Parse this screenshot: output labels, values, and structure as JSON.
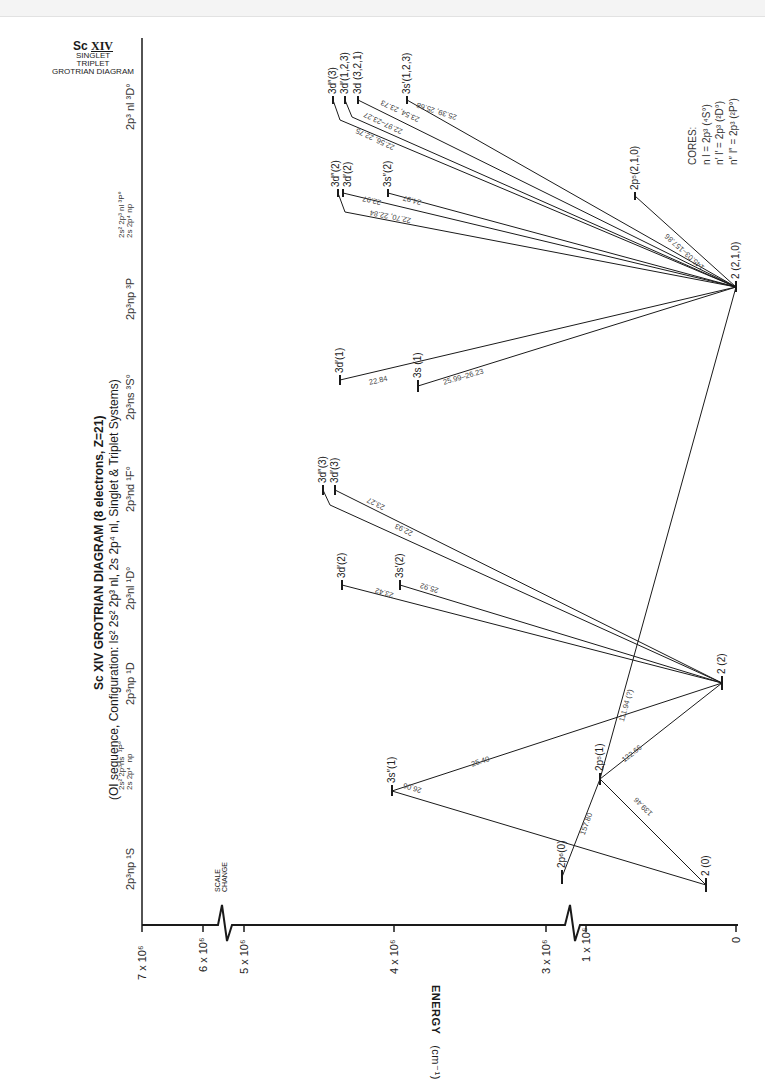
{
  "title_block": {
    "ion": "Sc",
    "ion_stage": "XIV",
    "line2": "SINGLET",
    "line3": "TRIPLET",
    "line4": "GROTRIAN  DIAGRAM"
  },
  "heading": {
    "line1": "Sc XIV  GROTRIAN DIAGRAM  (8 electrons, Z=21)",
    "line2": "(OI  sequence,  Configuration: ls² 2s² 2p³  nl, 2s 2p⁴ nl, Singlet & Triplet  Systems)"
  },
  "columns": [
    {
      "id": "1S",
      "label": "2p³np  ¹S"
    },
    {
      "id": "1Po",
      "label": "2s² 2p³ns  ¹P°\n2s 2p⁴  np"
    },
    {
      "id": "1D",
      "label": "2p³np  ¹D"
    },
    {
      "id": "1Do",
      "label": "2p³nl  ¹D°"
    },
    {
      "id": "1Fo",
      "label": "2p³nd ¹F°"
    },
    {
      "id": "3So",
      "label": "2p³ns  ³S°"
    },
    {
      "id": "3P",
      "label": "2p³np  ³P"
    },
    {
      "id": "3Po",
      "label": "2s² 2p³ nl ³P°\n2s 2p⁴ np"
    },
    {
      "id": "3Do",
      "label": "2p³ nl  ³D°"
    }
  ],
  "axis": {
    "title": "ENERGY",
    "unit": "(cm⁻¹)",
    "ticks": [
      "7 x 10⁶",
      "6 x 10⁶",
      "5 x 10⁶",
      "4 x 10⁶",
      "3 x 10⁶",
      "1 x 10⁶",
      "0"
    ],
    "scale_change_label": "SCALE\nCHANGE"
  },
  "cores": {
    "title": "CORES:",
    "lines": [
      "n l  =  2p³ (⁴S°)",
      "n′ l′  =  2p³ (²D°)",
      "n″ l″  =  2p³ (²P°)"
    ]
  },
  "levels": [
    {
      "id": "2_0",
      "label": "2 (0)"
    },
    {
      "id": "2p6_0",
      "label": "2p⁶(0)"
    },
    {
      "id": "2p5_1",
      "label": "2p⁵(1)"
    },
    {
      "id": "3s2_1",
      "label": "3s″(1)"
    },
    {
      "id": "2_2",
      "label": "2 (2)"
    },
    {
      "id": "3d2_2",
      "label": "3d′(2)"
    },
    {
      "id": "3s2_2b",
      "label": "3s′(2)"
    },
    {
      "id": "3dpp_3",
      "label": "3d″(3)"
    },
    {
      "id": "3dp_3",
      "label": "3d′(3)"
    },
    {
      "id": "3dp_1",
      "label": "3d′(1)"
    },
    {
      "id": "3s_1",
      "label": "3s (1)"
    },
    {
      "id": "2_210",
      "label": "2 (2,1,0)"
    },
    {
      "id": "3dpp_2",
      "label": "3d″(2)"
    },
    {
      "id": "3dp_2",
      "label": "3d′(2)"
    },
    {
      "id": "3spp_2",
      "label": "3s″(2)"
    },
    {
      "id": "2p5_210",
      "label": "2p⁵(2,1,0)"
    },
    {
      "id": "3dpp_3b",
      "label": "3d″(3)"
    },
    {
      "id": "3dp_123",
      "label": "3d′(1,2,3)"
    },
    {
      "id": "3d_321",
      "label": "3d (3,2,1)"
    },
    {
      "id": "3sp_123",
      "label": "3s′(1,2,3)"
    }
  ],
  "transitions": [
    {
      "label": "25.40"
    },
    {
      "label": "26.06"
    },
    {
      "label": "157.80"
    },
    {
      "label": "139.46"
    },
    {
      "label": "122.66"
    },
    {
      "label": "111.94 (?)"
    },
    {
      "label": "25.92"
    },
    {
      "label": "23.42"
    },
    {
      "label": "23.27"
    },
    {
      "label": "22.93"
    },
    {
      "label": "22.84"
    },
    {
      "label": "25.99–26.23"
    },
    {
      "label": "22.70, 22.84"
    },
    {
      "label": "22.97"
    },
    {
      "label": "24.97"
    },
    {
      "label": "145.03–157.86"
    },
    {
      "label": "22.56, 22.75"
    },
    {
      "label": "22.97–23.27"
    },
    {
      "label": "23.54, 23.73"
    },
    {
      "label": "25.39, 25.68"
    }
  ]
}
